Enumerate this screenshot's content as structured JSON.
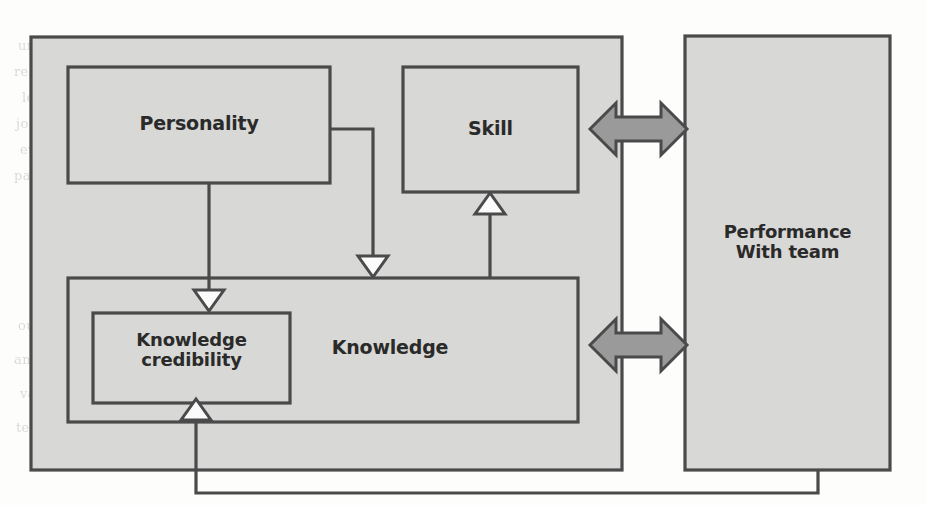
{
  "figure": {
    "type": "block-diagram",
    "title": "",
    "background_color": "#fdfdfc",
    "box_fill": "#d8d8d6",
    "box_stroke": "#4a4a4a",
    "arrow_fill": "#9a9a9a",
    "arrow_stroke": "#4a4a4a",
    "text_color": "#2a2a2a"
  },
  "nodes": {
    "personality": {
      "label": "Personality"
    },
    "skill": {
      "label": "Skill"
    },
    "knowledge": {
      "label": "Knowledge"
    },
    "knowledge_credibility": {
      "label": "Knowledge\ncredibility"
    },
    "performance": {
      "label": "Performance\nWith team"
    }
  },
  "edges": [
    {
      "from": "personality",
      "to": "knowledge_credibility",
      "style": "hollow-arrow-down"
    },
    {
      "from": "personality",
      "to": "knowledge",
      "style": "hollow-arrow-down"
    },
    {
      "from": "knowledge",
      "to": "skill",
      "style": "hollow-arrow-up"
    },
    {
      "from": "skill",
      "to": "performance",
      "style": "double-headed-block-arrow"
    },
    {
      "from": "knowledge",
      "to": "performance",
      "style": "double-headed-block-arrow"
    },
    {
      "from": "performance",
      "to": "knowledge_credibility",
      "style": "feedback-hollow-arrow-up"
    }
  ],
  "background_text": {
    "lines": [
      "understand why we can then know the order of programming the four major",
      "relation. The first row of the three variables is formed from the three steps of",
      "learning and each step is not identical. Other requirements. For example, I want to",
      "join this team to complete a program, and the members of the team will",
      "evaluate their personal competence by a scientific method. With these",
      "part from their related knowledge, and with their experience they knowledge",
      "our example, we will also make a simplified model of the team and personnel",
      "and they can be improve it and progress is inevitable because the work of the",
      "variables that they may be that it can prevent the problem from the stage of the",
      "team, in the model it makes to be that it must need to the"
    ]
  }
}
